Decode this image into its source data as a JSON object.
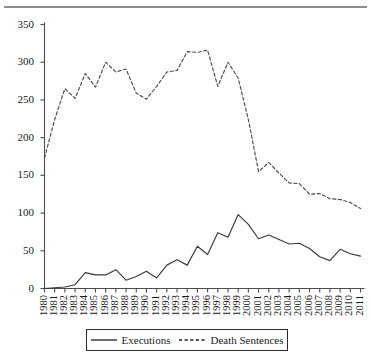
{
  "chart_data": {
    "type": "line",
    "title": "",
    "xlabel": "",
    "ylabel": "",
    "ylim": [
      0,
      350
    ],
    "yticks": [
      0,
      50,
      100,
      150,
      200,
      250,
      300,
      350
    ],
    "grid": false,
    "legend_position": "bottom-center",
    "x": [
      "1980",
      "1981",
      "1982",
      "1983",
      "1984",
      "1985",
      "1986",
      "1987",
      "1988",
      "1989",
      "1990",
      "1991",
      "1992",
      "1993",
      "1994",
      "1995",
      "1996",
      "1997",
      "1998",
      "1999",
      "2000",
      "2001",
      "2002",
      "2003",
      "2004",
      "2005",
      "2006",
      "2007",
      "2008",
      "2009",
      "2010",
      "2011"
    ],
    "series": [
      {
        "name": "Executions",
        "style": "solid",
        "color": "#3a3a3a",
        "values": [
          0,
          1,
          2,
          5,
          21,
          18,
          18,
          25,
          11,
          16,
          23,
          14,
          31,
          38,
          31,
          56,
          45,
          74,
          68,
          98,
          85,
          66,
          71,
          65,
          59,
          60,
          53,
          42,
          37,
          52,
          46,
          43
        ]
      },
      {
        "name": "Death Sentences",
        "style": "dashed",
        "color": "#4a4a4a",
        "values": [
          173,
          224,
          265,
          252,
          285,
          267,
          300,
          287,
          291,
          259,
          251,
          268,
          287,
          289,
          314,
          313,
          316,
          268,
          300,
          279,
          224,
          155,
          167,
          153,
          140,
          139,
          125,
          126,
          119,
          118,
          114,
          106
        ]
      }
    ],
    "legend": [
      {
        "label": "Executions",
        "style": "solid"
      },
      {
        "label": "Death Sentences",
        "style": "dashed"
      }
    ]
  }
}
